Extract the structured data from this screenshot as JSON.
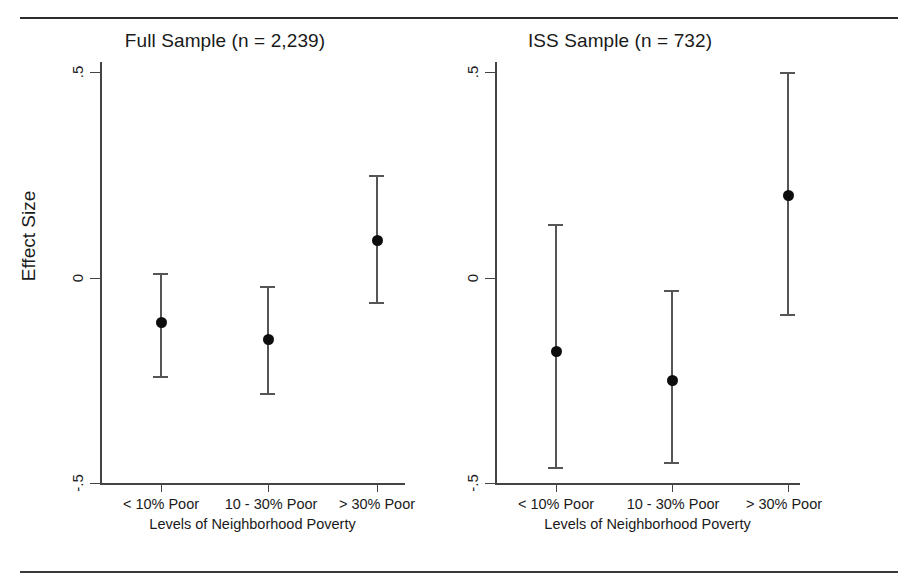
{
  "figure": {
    "panels": [
      {
        "id": "full-sample",
        "title": "Full Sample (n = 2,239)",
        "ylabel": "Effect Size",
        "xlabel": "Levels of Neighborhood Poverty"
      },
      {
        "id": "iss-sample",
        "title": "ISS Sample (n = 732)",
        "ylabel": "",
        "xlabel": "Levels of Neighborhood Poverty"
      }
    ],
    "yticks": [
      ".5",
      "0",
      "-.5"
    ],
    "xticks": [
      "< 10% Poor",
      "10 - 30% Poor",
      "> 30% Poor"
    ],
    "colors": {
      "line": "#555555",
      "marker": "#0d0d0d",
      "axis": "#444444",
      "rule": "#2b2b2b",
      "background": "#ffffff"
    }
  },
  "chart_data": [
    {
      "type": "scatter",
      "title": "Full Sample (n = 2,239)",
      "xlabel": "Levels of Neighborhood Poverty",
      "ylabel": "Effect Size",
      "categories": [
        "< 10% Poor",
        "10 - 30% Poor",
        "> 30% Poor"
      ],
      "values": [
        -0.11,
        -0.15,
        0.09
      ],
      "ci_low": [
        -0.24,
        -0.28,
        -0.06
      ],
      "ci_high": [
        0.01,
        -0.02,
        0.25
      ],
      "ylim": [
        -0.5,
        0.5
      ],
      "ytick_values": [
        0.5,
        0,
        -0.5
      ],
      "ytick_labels": [
        ".5",
        "0",
        "-.5"
      ],
      "grid": false,
      "legend": "none",
      "error_bar_style": "capped-whisker"
    },
    {
      "type": "scatter",
      "title": "ISS Sample (n = 732)",
      "xlabel": "Levels of Neighborhood Poverty",
      "ylabel": "Effect Size",
      "categories": [
        "< 10% Poor",
        "10 - 30% Poor",
        "> 30% Poor"
      ],
      "values": [
        -0.18,
        -0.25,
        0.2
      ],
      "ci_low": [
        -0.46,
        -0.45,
        -0.09
      ],
      "ci_high": [
        0.13,
        -0.03,
        0.5
      ],
      "ylim": [
        -0.5,
        0.5
      ],
      "ytick_values": [
        0.5,
        0,
        -0.5
      ],
      "ytick_labels": [
        ".5",
        "0",
        "-.5"
      ],
      "grid": false,
      "legend": "none",
      "error_bar_style": "capped-whisker"
    }
  ]
}
